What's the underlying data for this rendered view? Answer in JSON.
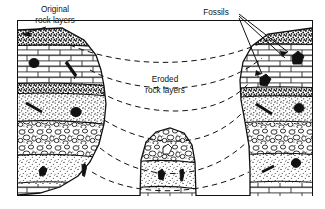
{
  "figure": {
    "kind": "geology-cross-section",
    "background": "#ffffff",
    "ink": "#111111",
    "frame": {
      "x": 17,
      "y": 20,
      "width": 296,
      "height": 176
    }
  },
  "labels": {
    "original_line1": "Original",
    "original_line2": "rock layers",
    "eroded_line1": "Eroded",
    "eroded_line2": "rock layers",
    "fossils": "Fossils"
  },
  "annotations": [
    {
      "name": "original-rock-layers-label",
      "text_lines": [
        "Original",
        "rock layers"
      ],
      "x": 55,
      "y": 14
    },
    {
      "name": "eroded-rock-layers-label",
      "text_lines": [
        "Eroded",
        "rock layers"
      ],
      "x": 165,
      "y": 80
    },
    {
      "name": "fossils-label",
      "text_lines": [
        "Fossils"
      ],
      "x": 219,
      "y": 13
    }
  ],
  "columns": [
    {
      "name": "left-butte",
      "label": "Original rock layers",
      "strata": [
        {
          "name": "stipple-cap",
          "pattern": "coarse-stipple"
        },
        {
          "name": "limestone-brick",
          "pattern": "brick",
          "fossils": 2
        },
        {
          "name": "dark-band",
          "pattern": "dark-stipple"
        },
        {
          "name": "sandstone-stipple",
          "pattern": "stipple",
          "fossils": 2
        },
        {
          "name": "conglomerate",
          "pattern": "pebble"
        },
        {
          "name": "fine-stipple",
          "pattern": "fine-stipple",
          "fossils": 2
        },
        {
          "name": "basal-brick",
          "pattern": "brick"
        }
      ]
    },
    {
      "name": "middle-mound",
      "label": "Eroded remnant",
      "strata": [
        {
          "name": "conglomerate",
          "pattern": "pebble"
        },
        {
          "name": "fine-stipple",
          "pattern": "fine-stipple",
          "fossils": 2
        },
        {
          "name": "basal-brick",
          "pattern": "brick"
        }
      ]
    },
    {
      "name": "right-butte",
      "label": "Fossils",
      "strata": [
        {
          "name": "stipple-cap",
          "pattern": "coarse-stipple"
        },
        {
          "name": "limestone-brick",
          "pattern": "brick",
          "fossils": 2
        },
        {
          "name": "dark-band",
          "pattern": "dark-stipple"
        },
        {
          "name": "sandstone-stipple",
          "pattern": "stipple",
          "fossils": 2
        },
        {
          "name": "conglomerate",
          "pattern": "pebble"
        },
        {
          "name": "fine-stipple",
          "pattern": "fine-stipple",
          "fossils": 2
        },
        {
          "name": "basal-brick",
          "pattern": "brick"
        }
      ]
    }
  ],
  "correlation_lines": {
    "name": "dashed-correlation-curves",
    "style": "dashed",
    "count": 5,
    "description": "Dashed curves connecting matching strata across the eroded gaps"
  },
  "leader_lines": {
    "fossils_count": 3,
    "original_count": 1
  }
}
